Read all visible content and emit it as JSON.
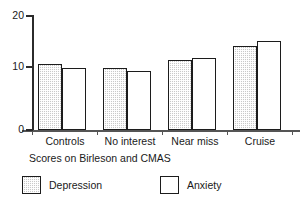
{
  "chart_data": {
    "type": "bar",
    "title": "",
    "subtitle": "",
    "xlabel": "Scores on Birleson and CMAS",
    "ylabel": "",
    "categories": [
      "Controls",
      "No interest",
      "Near miss",
      "Cruise"
    ],
    "series": [
      {
        "name": "Depression",
        "values": [
          11.5,
          10.9,
          12.3,
          14.8
        ],
        "fill": "#c9c9c9",
        "pattern": "fine-checker",
        "edge_color": "#1c1c1c"
      },
      {
        "name": "Anxiety",
        "values": [
          10.9,
          10.3,
          12.7,
          15.6
        ],
        "fill": "#ffffff",
        "pattern": "none",
        "edge_color": "#1c1c1c"
      }
    ],
    "ylim": [
      0,
      20
    ],
    "y_ticks": [
      0,
      10,
      20
    ],
    "y_tick_labels": [
      "0",
      "10",
      "20"
    ],
    "grid": false,
    "legend_position": "below-axes",
    "legend_entries": [
      "Depression",
      "Anxiety"
    ],
    "annotations": []
  },
  "axes": {
    "y_tick_labels": [
      "20",
      "10",
      "0"
    ],
    "x_tick_labels": [
      "Controls",
      "No interest",
      "Near miss",
      "Cruise"
    ],
    "x_axis_title": "Scores on Birleson and CMAS"
  },
  "legend": {
    "items": [
      {
        "label": "Depression",
        "swatch": "gray-hatched-swatch"
      },
      {
        "label": "Anxiety",
        "swatch": "white-swatch"
      }
    ]
  },
  "colors": {
    "depression_fill": "#c9c9c9",
    "anxiety_fill": "#ffffff",
    "bar_edge": "#1c1c1c",
    "axis": "#2b2b2b",
    "text": "#1a1a1a",
    "background": "#ffffff"
  }
}
